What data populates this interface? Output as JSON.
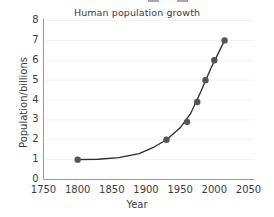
{
  "chart_data": {
    "type": "scatter",
    "title": "Human population growth",
    "xlabel": "Year",
    "ylabel": "Population/billions",
    "xlim": [
      1750,
      2050
    ],
    "ylim": [
      0,
      8
    ],
    "xticks": [
      1750,
      1800,
      1850,
      1900,
      1950,
      2000,
      2050
    ],
    "xtick_labels": [
      "1750",
      "1800",
      "1850",
      "1900",
      "1950",
      "2000",
      "2050"
    ],
    "yticks": [
      0,
      1,
      2,
      3,
      4,
      5,
      6,
      7,
      8
    ],
    "ytick_labels": [
      "0",
      "1",
      "2",
      "3",
      "4",
      "5",
      "6",
      "7",
      "8"
    ],
    "grid": true,
    "grid_color": "#f2f2f2",
    "legend": false,
    "marker_color": "#555555",
    "line_color": "#2b2b2b",
    "axis_color": "#9a9a9a",
    "x": [
      1800,
      1930,
      1960,
      1975,
      1987,
      2000,
      2015
    ],
    "y": [
      1.0,
      2.0,
      2.9,
      3.9,
      5.0,
      6.0,
      7.0
    ],
    "points": [
      {
        "year": 1800,
        "population": 1.0
      },
      {
        "year": 1930,
        "population": 2.0
      },
      {
        "year": 1960,
        "population": 2.9
      },
      {
        "year": 1975,
        "population": 3.9
      },
      {
        "year": 1987,
        "population": 5.0
      },
      {
        "year": 2000,
        "population": 6.0
      },
      {
        "year": 2015,
        "population": 7.0
      }
    ],
    "trend_line": {
      "description": "smooth exponential curve through the points",
      "x": [
        1800,
        1830,
        1860,
        1890,
        1910,
        1930,
        1950,
        1965,
        1980,
        1995,
        2015
      ],
      "y": [
        1.0,
        1.02,
        1.1,
        1.3,
        1.6,
        2.0,
        2.6,
        3.3,
        4.4,
        5.6,
        7.0
      ]
    }
  }
}
